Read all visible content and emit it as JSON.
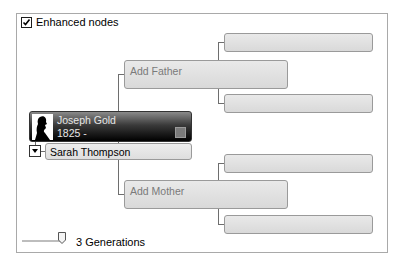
{
  "options": {
    "enhanced_nodes_label": "Enhanced nodes",
    "enhanced_nodes_checked": true
  },
  "root": {
    "name": "Joseph Gold",
    "years": "1825 -",
    "icon": "silhouette-icon"
  },
  "spouse": {
    "name": "Sarah Thompson"
  },
  "parents": {
    "father_label": "Add Father",
    "mother_label": "Add Mother"
  },
  "slider": {
    "generations_label": "3 Generations",
    "value": 3
  },
  "colors": {
    "node_gray": "#e0e0e0",
    "root_dark": "#000000",
    "line": "#6e6e6e"
  }
}
